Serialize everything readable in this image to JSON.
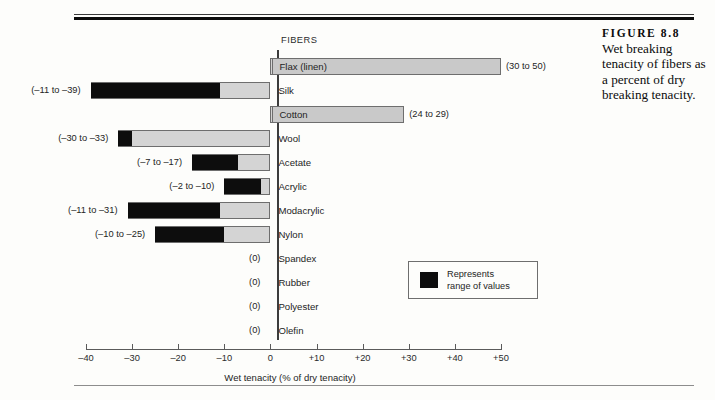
{
  "figure": {
    "label": "FIGURE 8.8",
    "caption": "Wet breaking tenacity of fibers as a percent of dry breaking tenacity."
  },
  "legend": {
    "line1": "Represents",
    "line2": "range of values"
  },
  "chart_data": {
    "type": "bar",
    "orientation": "horizontal",
    "title": "Wet breaking tenacity of fibers as a percent of dry breaking tenacity.",
    "column_header": "FIBERS",
    "xlabel": "Wet tenacity (% of dry tenacity)",
    "ylabel": "",
    "xlim": [
      -40,
      50
    ],
    "xticks": [
      -40,
      -30,
      -20,
      -10,
      0,
      10,
      20,
      30,
      40,
      50
    ],
    "xticklabels": [
      "–40",
      "–30",
      "–20",
      "–10",
      "0",
      "+10",
      "+20",
      "+30",
      "+40",
      "+50"
    ],
    "grid": false,
    "legend_position": "inside-right",
    "categories": [
      "Flax (linen)",
      "Silk",
      "Cotton",
      "Wool",
      "Acetate",
      "Acrylic",
      "Modacrylic",
      "Nylon",
      "Spandex",
      "Rubber",
      "Polyester",
      "Olefin"
    ],
    "bars": [
      {
        "name": "Flax (linen)",
        "low": 30,
        "high": 50,
        "extent_from": 0,
        "extent_to": 50,
        "range_label": "(30 to 50)",
        "label_side": "right",
        "shaded_name": true
      },
      {
        "name": "Silk",
        "low": -39,
        "high": -11,
        "extent_from": -39,
        "extent_to": 0,
        "range_label": "(–11 to –39)",
        "label_side": "left",
        "shaded_name": false
      },
      {
        "name": "Cotton",
        "low": 24,
        "high": 29,
        "extent_from": 0,
        "extent_to": 29,
        "range_label": "(24 to 29)",
        "label_side": "right",
        "shaded_name": true
      },
      {
        "name": "Wool",
        "low": -33,
        "high": -30,
        "extent_from": -33,
        "extent_to": 0,
        "range_label": "(–30 to –33)",
        "label_side": "left",
        "shaded_name": false
      },
      {
        "name": "Acetate",
        "low": -17,
        "high": -7,
        "extent_from": -17,
        "extent_to": 0,
        "range_label": "(–7 to –17)",
        "label_side": "left",
        "shaded_name": false
      },
      {
        "name": "Acrylic",
        "low": -10,
        "high": -2,
        "extent_from": -10,
        "extent_to": 0,
        "range_label": "(–2 to –10)",
        "label_side": "left",
        "shaded_name": false
      },
      {
        "name": "Modacrylic",
        "low": -31,
        "high": -11,
        "extent_from": -31,
        "extent_to": 0,
        "range_label": "(–11 to –31)",
        "label_side": "left",
        "shaded_name": false
      },
      {
        "name": "Nylon",
        "low": -25,
        "high": -10,
        "extent_from": -25,
        "extent_to": 0,
        "range_label": "(–10 to –25)",
        "label_side": "left",
        "shaded_name": false
      },
      {
        "name": "Spandex",
        "low": 0,
        "high": 0,
        "extent_from": 0,
        "extent_to": 0,
        "range_label": "(0)",
        "label_side": "left",
        "shaded_name": false
      },
      {
        "name": "Rubber",
        "low": 0,
        "high": 0,
        "extent_from": 0,
        "extent_to": 0,
        "range_label": "(0)",
        "label_side": "left",
        "shaded_name": false
      },
      {
        "name": "Polyester",
        "low": 0,
        "high": 0,
        "extent_from": 0,
        "extent_to": 0,
        "range_label": "(0)",
        "label_side": "left",
        "shaded_name": false
      },
      {
        "name": "Olefin",
        "low": 0,
        "high": 0,
        "extent_from": 0,
        "extent_to": 0,
        "range_label": "(0)",
        "label_side": "left",
        "shaded_name": false
      }
    ],
    "colors": {
      "range_fill": "#0d0d0d",
      "extent_fill": "#d4d4d4",
      "outline": "#6e6e6e",
      "axis": "#5a5a5a",
      "name_shade": "#c9c9c9"
    }
  }
}
